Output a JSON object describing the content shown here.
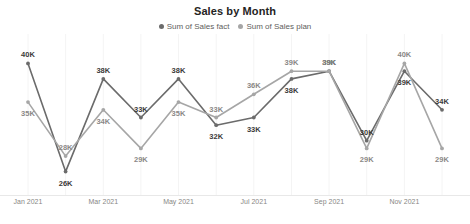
{
  "chart": {
    "title": "Sales by Month",
    "legend": [
      {
        "label": "Sum of Sales fact",
        "color": "#6b6b6b"
      },
      {
        "label": "Sum of Sales plan",
        "color": "#a6a6a6"
      }
    ]
  },
  "chart_data": {
    "type": "line",
    "title": "Sales by Month",
    "xlabel": "",
    "ylabel": "",
    "grid": false,
    "legend_position": "top",
    "ylim": [
      24000,
      42000
    ],
    "x": [
      "Jan 2021",
      "Feb 2021",
      "Mar 2021",
      "Apr 2021",
      "May 2021",
      "Jun 2021",
      "Jul 2021",
      "Aug 2021",
      "Sep 2021",
      "Oct 2021",
      "Nov 2021",
      "Dec 2021"
    ],
    "tick_labels": [
      "Jan 2021",
      "Mar 2021",
      "May 2021",
      "Jul 2021",
      "Sep 2021",
      "Nov 2021"
    ],
    "tick_indices": [
      0,
      2,
      4,
      6,
      8,
      10
    ],
    "series": [
      {
        "name": "Sum of Sales fact",
        "color": "#6b6b6b",
        "values": [
          40000,
          26000,
          38000,
          33000,
          38000,
          32000,
          33000,
          38000,
          39000,
          30000,
          39000,
          34000
        ],
        "data_labels": [
          "40K",
          "26K",
          "38K",
          "33K",
          "38K",
          "32K",
          "33K",
          "38K",
          "39K",
          "30K",
          "39K",
          "34K"
        ]
      },
      {
        "name": "Sum of Sales plan",
        "color": "#a6a6a6",
        "values": [
          35000,
          28000,
          34000,
          29000,
          35000,
          33000,
          36000,
          39000,
          39000,
          29000,
          40000,
          29000
        ],
        "data_labels": [
          "35K",
          "28K",
          "34K",
          "29K",
          "35K",
          "33K",
          "36K",
          "39K",
          "39K",
          "29K",
          "40K",
          "29K"
        ]
      }
    ]
  }
}
